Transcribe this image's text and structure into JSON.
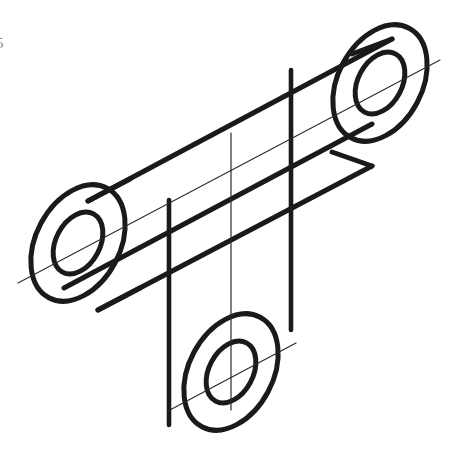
{
  "page": {
    "width": 450,
    "height": 464,
    "background": "#ffffff",
    "margin_label": "5"
  },
  "style": {
    "object_line_color": "#1a1a1a",
    "object_line_width": 5.0,
    "hidden_line_width": 4.6,
    "center_line_color": "#2b2b2b",
    "center_line_width": 1.1,
    "construction_line_width": 1.2,
    "label_color": "#8d8d8d"
  },
  "drawing": {
    "type": "isometric-pictorial",
    "subject": "three-boss T-shaped link with through holes",
    "projection": "isometric",
    "bosses": [
      {
        "name": "left-boss",
        "center": [
          78,
          243
        ],
        "outer_rx": 62,
        "outer_ry": 42,
        "inner_rx": 33,
        "inner_ry": 22,
        "rotation_deg": -62,
        "center_line": "vertical"
      },
      {
        "name": "right-boss",
        "center": [
          380,
          83
        ],
        "outer_rx": 62,
        "outer_ry": 42,
        "inner_rx": 33,
        "inner_ry": 22,
        "rotation_deg": -62,
        "center_line": "diagonal"
      },
      {
        "name": "bottom-boss",
        "center": [
          231,
          372
        ],
        "outer_rx": 62,
        "outer_ry": 42,
        "inner_rx": 33,
        "inner_ry": 22,
        "rotation_deg": -62,
        "center_line": "vertical-and-diagonal"
      }
    ],
    "webs": [
      {
        "name": "upper-web",
        "description": "long diagonal web joining left boss to right boss"
      },
      {
        "name": "lower-web",
        "description": "short vertical web dropping to bottom boss"
      }
    ],
    "vertical_edges": [
      {
        "name": "edge-left",
        "x": 169,
        "y_top": 200,
        "y_bottom": 425,
        "weight": "thick"
      },
      {
        "name": "edge-middle",
        "x": 231,
        "y_top": 133,
        "y_bottom": 410,
        "weight": "thin"
      },
      {
        "name": "edge-right",
        "x": 291,
        "y_top": 70,
        "y_bottom": 330,
        "weight": "thick"
      }
    ],
    "centerlines": [
      {
        "name": "main-axis-centerline",
        "from": [
          18,
          283
        ],
        "to": [
          440,
          60
        ]
      }
    ]
  }
}
